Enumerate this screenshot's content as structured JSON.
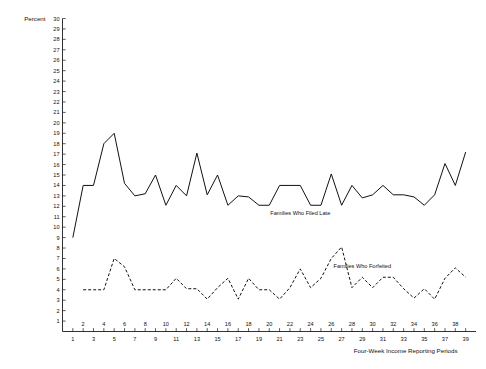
{
  "chart_data": {
    "type": "line",
    "title": "",
    "subtitle": "",
    "ylabel": "Percent",
    "xlabel": "Four-Week Income Reporting Periods",
    "ylim": [
      0,
      30
    ],
    "xlim": [
      0,
      40
    ],
    "grid": false,
    "legend_position": "inline-annotation",
    "y_ticks": [
      1,
      2,
      3,
      4,
      5,
      6,
      7,
      8,
      9,
      10,
      11,
      12,
      13,
      14,
      15,
      16,
      17,
      18,
      19,
      20,
      21,
      22,
      23,
      24,
      25,
      26,
      27,
      28,
      29,
      30
    ],
    "x_ticks_upper": [
      2,
      4,
      6,
      8,
      10,
      12,
      14,
      16,
      18,
      20,
      22,
      24,
      26,
      28,
      30,
      32,
      34,
      36,
      38
    ],
    "x_ticks_lower": [
      1,
      3,
      5,
      7,
      9,
      11,
      13,
      15,
      17,
      19,
      21,
      23,
      25,
      27,
      29,
      31,
      33,
      35,
      37,
      39
    ],
    "x": [
      1,
      2,
      3,
      4,
      5,
      6,
      7,
      8,
      9,
      10,
      11,
      12,
      13,
      14,
      15,
      16,
      17,
      18,
      19,
      20,
      21,
      22,
      23,
      24,
      25,
      26,
      27,
      28,
      29,
      30,
      31,
      32,
      33,
      34,
      35,
      36,
      37,
      38,
      39
    ],
    "series": [
      {
        "name": "Families Who Filed Late",
        "style": "solid",
        "annotation": "Families Who Filed Late",
        "annotation_x": 23,
        "annotation_y": 11.2,
        "x": [
          1,
          2,
          3,
          4,
          5,
          6,
          7,
          8,
          9,
          10,
          11,
          12,
          13,
          14,
          15,
          16,
          17,
          18,
          19,
          20,
          21,
          22,
          23,
          24,
          25,
          26,
          27,
          28,
          29,
          30,
          31,
          32,
          33,
          34,
          35,
          36,
          37,
          38,
          39
        ],
        "values": [
          9,
          14,
          14,
          18,
          19,
          14.2,
          13,
          13.2,
          15,
          12.1,
          14,
          13,
          17.1,
          13.1,
          15,
          12.1,
          13,
          12.9,
          12.1,
          12.1,
          14,
          14,
          14,
          12.1,
          12.1,
          15.1,
          12.1,
          14,
          12.8,
          13.1,
          14,
          13.1,
          13.1,
          12.9,
          12.1,
          13.1,
          16.1,
          14,
          17.2
        ]
      },
      {
        "name": "Families Who Forfeited",
        "style": "dashed",
        "annotation": "Families Who Forfeited",
        "annotation_x": 29,
        "annotation_y": 6.1,
        "x": [
          2,
          3,
          4,
          5,
          6,
          7,
          8,
          9,
          10,
          11,
          12,
          13,
          14,
          15,
          16,
          17,
          18,
          19,
          20,
          21,
          22,
          23,
          24,
          25,
          26,
          27,
          28,
          29,
          30,
          31,
          32,
          33,
          34,
          35,
          36,
          37,
          38,
          39
        ],
        "values": [
          4,
          4,
          4,
          7,
          6.2,
          4,
          4,
          4,
          4,
          5.1,
          4.1,
          4.1,
          3.1,
          4.2,
          5.1,
          3.1,
          5.1,
          4,
          4,
          3.1,
          4.2,
          6,
          4.2,
          5.1,
          7,
          8.1,
          4.2,
          5.2,
          4.2,
          5.2,
          5.2,
          4.1,
          3.2,
          4.1,
          3.1,
          5.1,
          6.1,
          5.2
        ]
      }
    ]
  }
}
